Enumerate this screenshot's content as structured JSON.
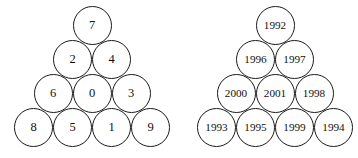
{
  "figure": {
    "kind": "circle-packing-triangles",
    "background_color": "#ffffff",
    "stroke_color": "#1a1a1a",
    "text_color": "#111111",
    "circle_diameter": 39,
    "row_pitch": 34
  },
  "pyramids": [
    {
      "name": "left-pyramid",
      "origin_x": 14,
      "origin_y": 108,
      "rows": [
        {
          "index": 0,
          "labels": [
            "8",
            "5",
            "1",
            "9"
          ]
        },
        {
          "index": 1,
          "labels": [
            "6",
            "0",
            "3"
          ]
        },
        {
          "index": 2,
          "labels": [
            "2",
            "4"
          ]
        },
        {
          "index": 3,
          "labels": [
            "7"
          ]
        }
      ]
    },
    {
      "name": "right-pyramid",
      "origin_x": 197,
      "origin_y": 108,
      "rows": [
        {
          "index": 0,
          "labels": [
            "1993",
            "1995",
            "1999",
            "1994"
          ]
        },
        {
          "index": 1,
          "labels": [
            "2000",
            "2001",
            "1998"
          ]
        },
        {
          "index": 2,
          "labels": [
            "1996",
            "1997"
          ]
        },
        {
          "index": 3,
          "labels": [
            "1992"
          ]
        }
      ]
    }
  ]
}
